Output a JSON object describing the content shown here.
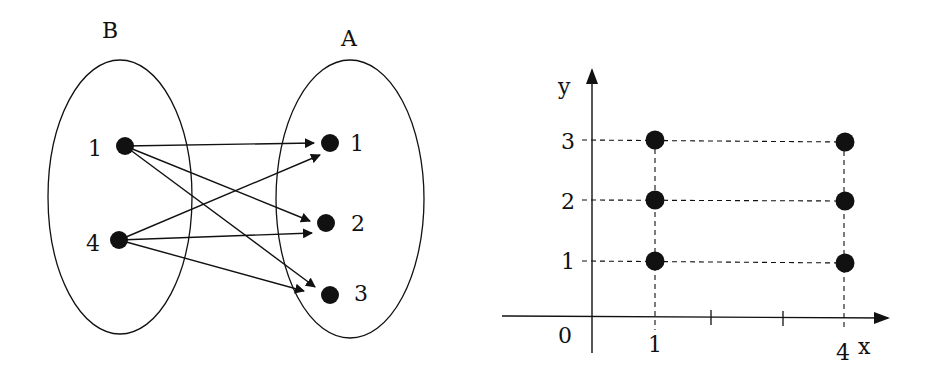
{
  "mapping_diagram": {
    "left_set": {
      "label": "B",
      "elements": [
        {
          "label": "1",
          "cx": 125,
          "cy": 146
        },
        {
          "label": "4",
          "cx": 119,
          "cy": 240
        }
      ]
    },
    "right_set": {
      "label": "A",
      "elements": [
        {
          "label": "1",
          "cx": 330,
          "cy": 143
        },
        {
          "label": "2",
          "cx": 326,
          "cy": 223
        },
        {
          "label": "3",
          "cx": 330,
          "cy": 295
        }
      ]
    },
    "arrows": [
      {
        "from": "B.1",
        "to": "A.1"
      },
      {
        "from": "B.1",
        "to": "A.2"
      },
      {
        "from": "B.1",
        "to": "A.3"
      },
      {
        "from": "B.4",
        "to": "A.1"
      },
      {
        "from": "B.4",
        "to": "A.2"
      },
      {
        "from": "B.4",
        "to": "A.3"
      }
    ]
  },
  "coordinate_plot": {
    "x_axis_label": "x",
    "y_axis_label": "y",
    "origin_label": "0",
    "x_tick_labels": [
      "1",
      "4"
    ],
    "y_tick_labels": [
      "1",
      "2",
      "3"
    ],
    "points": [
      {
        "x": 1,
        "y": 1
      },
      {
        "x": 1,
        "y": 2
      },
      {
        "x": 1,
        "y": 3
      },
      {
        "x": 4,
        "y": 1
      },
      {
        "x": 4,
        "y": 2
      },
      {
        "x": 4,
        "y": 3
      }
    ]
  },
  "colors": {
    "ink": "#111111",
    "background": "#ffffff"
  }
}
